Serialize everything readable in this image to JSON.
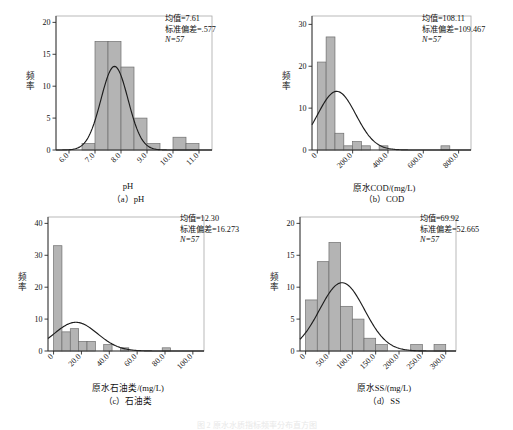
{
  "figure": {
    "caption_faint": "图 2  原水水质指标频率分布直方图",
    "panels_count": 4
  },
  "labels": {
    "frequency_axis": "频率",
    "mean_prefix": "均值=",
    "sd_prefix": "标准偏差=",
    "n_prefix": "N="
  },
  "chart_data": [
    {
      "id": "a",
      "type": "bar",
      "title": "",
      "panel_label": "（a）pH",
      "xlabel": "pH",
      "ylabel": "频率",
      "xlim": [
        5.5,
        11.5
      ],
      "ylim": [
        0,
        21
      ],
      "xticks": [
        "6.0",
        "7.0",
        "8.0",
        "9.0",
        "10.0",
        "11.0"
      ],
      "xtick_values": [
        6.0,
        7.0,
        8.0,
        9.0,
        10.0,
        11.0
      ],
      "yticks": [
        "0",
        "5",
        "10",
        "15",
        "20"
      ],
      "ytick_values": [
        0,
        5,
        10,
        15,
        20
      ],
      "bin_width": 0.5,
      "bin_starts": [
        6.5,
        7.0,
        7.5,
        8.0,
        8.5,
        9.0,
        10.0
      ],
      "values": [
        1,
        17,
        17,
        13,
        5,
        1,
        2
      ],
      "extra_bars": [
        {
          "start": 10.5,
          "value": 1
        }
      ],
      "curve": {
        "mean": 7.75,
        "sd": 0.52,
        "peak": 13.1
      },
      "stats": {
        "mean": "均值=7.61",
        "sd": "标准偏差=.577",
        "n": "N=57"
      },
      "grid": false,
      "legend": "none"
    },
    {
      "id": "b",
      "type": "bar",
      "title": "",
      "panel_label": "（b）COD",
      "xlabel": "原水COD/(mg/L)",
      "ylabel": "频率",
      "xlim": [
        -30,
        870
      ],
      "ylim": [
        0,
        32
      ],
      "xticks": [
        "0",
        "200.0",
        "400.0",
        "600.0",
        "800.0"
      ],
      "xtick_values": [
        0,
        200,
        400,
        600,
        800
      ],
      "yticks": [
        "0",
        "10",
        "20",
        "30"
      ],
      "ytick_values": [
        0,
        10,
        20,
        30
      ],
      "bin_width": 50,
      "bin_starts": [
        0,
        50,
        100,
        150,
        200,
        250,
        350,
        700
      ],
      "values": [
        21,
        27,
        4,
        1,
        2,
        1,
        1,
        1
      ],
      "curve": {
        "mean": 110,
        "sd": 108,
        "peak": 14
      },
      "stats": {
        "mean": "均值=108.11",
        "sd": "标准偏差=109.467",
        "n": "N=57"
      },
      "grid": false,
      "legend": "none"
    },
    {
      "id": "c",
      "type": "bar",
      "title": "",
      "panel_label": "（c）石油类",
      "xlabel": "原水石油类/(mg/L)",
      "ylabel": "频率",
      "xlim": [
        -4,
        108
      ],
      "ylim": [
        0,
        42
      ],
      "xticks": [
        "0",
        "20.0",
        "40.0",
        "60.0",
        "80.0",
        "100.0"
      ],
      "xtick_values": [
        0,
        20,
        40,
        60,
        80,
        100
      ],
      "yticks": [
        "0",
        "10",
        "20",
        "30",
        "40"
      ],
      "ytick_values": [
        0,
        10,
        20,
        30,
        40
      ],
      "bin_width": 6,
      "bin_starts": [
        0,
        6,
        12,
        18,
        24,
        36,
        48,
        78
      ],
      "values": [
        33,
        6,
        7,
        3,
        3,
        2,
        1,
        1
      ],
      "curve": {
        "mean": 16,
        "sd": 15.5,
        "peak": 9
      },
      "stats": {
        "mean": "均值=12.30",
        "sd": "标准偏差=16.273",
        "n": "N=57"
      },
      "grid": false,
      "legend": "none"
    },
    {
      "id": "d",
      "type": "bar",
      "title": "",
      "panel_label": "（d）SS",
      "xlabel": "原水SS/(mg/L)",
      "ylabel": "频率",
      "xlim": [
        -12,
        322
      ],
      "ylim": [
        0,
        21
      ],
      "xticks": [
        "0",
        "50.0",
        "100.0",
        "150.0",
        "200.0",
        "250.0",
        "300.0"
      ],
      "xtick_values": [
        0,
        50,
        100,
        150,
        200,
        250,
        300
      ],
      "yticks": [
        "0",
        "5",
        "10",
        "15",
        "20"
      ],
      "ytick_values": [
        0,
        5,
        10,
        15,
        20
      ],
      "bin_width": 25,
      "bin_starts": [
        0,
        25,
        50,
        75,
        100,
        125,
        150,
        225,
        275
      ],
      "values": [
        8,
        14,
        17,
        7,
        5,
        2,
        1,
        1,
        1
      ],
      "curve": {
        "mean": 78,
        "sd": 48,
        "peak": 10.7
      },
      "stats": {
        "mean": "均值=69.92",
        "sd": "标准偏差=52.665",
        "n": "N=57"
      },
      "grid": false,
      "legend": "none"
    }
  ]
}
